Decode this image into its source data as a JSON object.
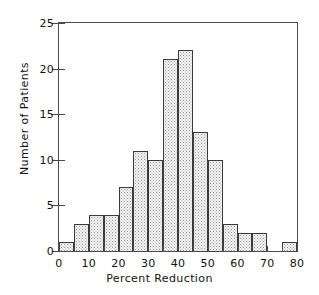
{
  "chart_data": {
    "type": "bar",
    "title": "",
    "subtitle": "",
    "xlabel": "Percent Reduction",
    "ylabel": "Number of Patients",
    "categories": [
      "0-5",
      "5-10",
      "10-15",
      "15-20",
      "20-25",
      "25-30",
      "30-35",
      "35-40",
      "40-45",
      "45-50",
      "50-55",
      "55-60",
      "60-65",
      "65-70",
      "70-75",
      "75-80"
    ],
    "bin_starts": [
      0,
      5,
      10,
      15,
      20,
      25,
      30,
      35,
      40,
      45,
      50,
      55,
      60,
      65,
      70,
      75
    ],
    "bin_width": 5,
    "values": [
      1,
      3,
      4,
      4,
      7,
      11,
      10,
      21,
      22,
      13,
      10,
      3,
      2,
      2,
      0,
      1
    ],
    "xlim": [
      0,
      80
    ],
    "ylim": [
      0,
      25
    ],
    "xticks": [
      0,
      5,
      10,
      15,
      20,
      25,
      30,
      35,
      40,
      45,
      50,
      55,
      60,
      65,
      70,
      75,
      80
    ],
    "xtick_labels": [
      "0",
      "",
      "10",
      "",
      "20",
      "",
      "30",
      "",
      "40",
      "",
      "50",
      "",
      "60",
      "",
      "70",
      "",
      "80"
    ],
    "yticks": [
      0,
      5,
      10,
      15,
      20,
      25
    ],
    "ytick_labels": [
      "0",
      "5",
      "10",
      "15",
      "20",
      "25"
    ],
    "grid": false,
    "legend": null,
    "bar_fill": "#f2f2f2",
    "bar_edge": "#3b3b3b",
    "axis_color": "#4a4a4a",
    "text_color": "#111111",
    "background": "#ffffff"
  }
}
